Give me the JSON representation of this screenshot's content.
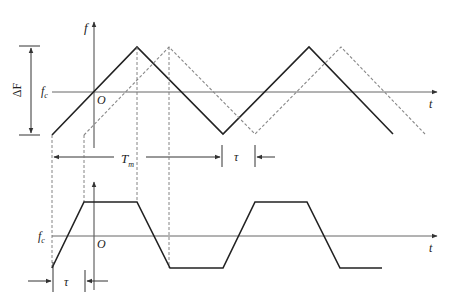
{
  "labels": {
    "f_axis": "f",
    "t_axis_top": "t",
    "t_axis_bottom": "t",
    "origin_top": "O",
    "origin_bottom": "O",
    "fc_top": "f",
    "fc_top_sub": "c",
    "fc_bottom": "f",
    "fc_bottom_sub": "c",
    "delta_f": "ΔF",
    "tm": "T",
    "tm_sub": "m",
    "tau_top": "τ",
    "tau_bottom": "τ"
  },
  "colors": {
    "solid": "#222222",
    "dashed": "#888888",
    "axis": "#444444"
  }
}
